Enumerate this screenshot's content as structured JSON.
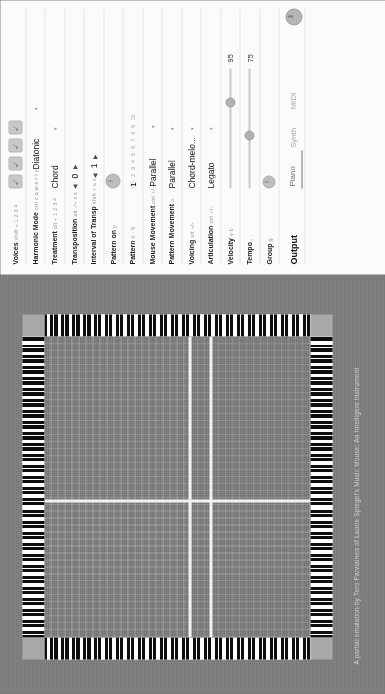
{
  "app": {
    "title": "Music Mouse",
    "credit": "A partial emulation by Tero Parviainen of Laurie Spiegel's Music Mouse: An Intelligent Instrument"
  },
  "colors": {
    "background": "#7d7d7d",
    "panel": "#fbfbfb",
    "grid": "#7a7a7a",
    "crosshair": "#f2f2f2",
    "key_white": "#fdfdfd",
    "key_black": "#0d0d0d",
    "corner": "#a8a8a8"
  },
  "canvas": {
    "name": "music-mouse-grid",
    "crosshair_vertical_pct": 45,
    "crosshair_horizontal_pcts": [
      54,
      62
    ],
    "keyboard_edges": [
      "top",
      "bottom",
      "left",
      "right"
    ]
  },
  "panel": {
    "rows": [
      {
        "label": "Voices",
        "hint": "shift + 1 2 3 4",
        "type": "voice-toggles",
        "voices": [
          {
            "name": "voice-1",
            "checked": true
          },
          {
            "name": "voice-2",
            "checked": true
          },
          {
            "name": "voice-3",
            "checked": true
          },
          {
            "name": "voice-4",
            "checked": true
          }
        ]
      },
      {
        "label": "Harmonic Mode",
        "hint": "ctrl c q w e r t y",
        "type": "select",
        "value": "Diatonic"
      },
      {
        "label": "Treatment",
        "hint": "alt + 1 2 3 4",
        "type": "select",
        "value": "Chord"
      },
      {
        "label": "Transposition",
        "hint": "alt -/+ z x",
        "type": "stepper",
        "value": "0"
      },
      {
        "label": "Interval of Transp",
        "hint": "shift + a s",
        "type": "stepper",
        "value": "1"
      },
      {
        "label": "Pattern on",
        "hint": "p",
        "type": "knob",
        "value": ""
      },
      {
        "label": "Pattern",
        "hint": "0 - 9",
        "type": "numscale",
        "options": [
          "1",
          "2",
          "3",
          "4",
          "5",
          "6",
          "7",
          "8",
          "9",
          "10"
        ],
        "value": "1"
      },
      {
        "label": "Mouse Movement",
        "hint": "ctrl +/-",
        "type": "select",
        "value": "Parallel"
      },
      {
        "label": "Pattern Movement",
        "hint": "o",
        "type": "select",
        "value": "Parallel"
      },
      {
        "label": "Voicing",
        "hint": "alt +/-",
        "type": "select",
        "value": "Chord-melo..."
      },
      {
        "label": "Articulation",
        "hint": "ctrl +/-",
        "type": "select",
        "value": "Legato"
      },
      {
        "label": "Velocity",
        "hint": "v b",
        "type": "slider",
        "value": "95",
        "pct": 72
      },
      {
        "label": "Tempo",
        "hint": ", .",
        "type": "slider",
        "value": "75",
        "pct": 44
      },
      {
        "label": "Group",
        "hint": "g",
        "type": "knob-small",
        "value": ""
      }
    ],
    "output": {
      "label": "Output",
      "tabs": [
        {
          "name": "tab-piano",
          "label": "Piano",
          "active": true
        },
        {
          "name": "tab-synth",
          "label": "Synth",
          "active": false
        },
        {
          "name": "tab-midi",
          "label": "MIDI",
          "active": false
        }
      ]
    }
  }
}
